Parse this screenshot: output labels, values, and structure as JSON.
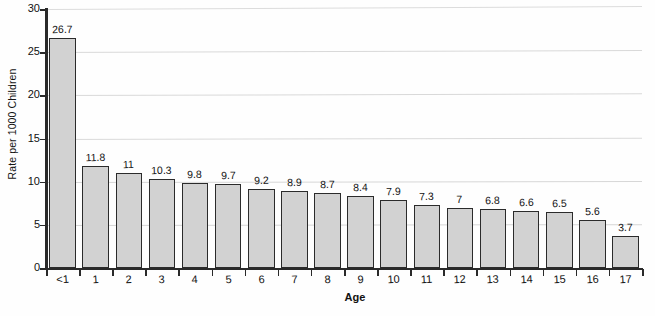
{
  "chart_data": {
    "type": "bar",
    "title": "",
    "xlabel": "Age",
    "ylabel": "Rate per 1000 Children",
    "categories": [
      "<1",
      "1",
      "2",
      "3",
      "4",
      "5",
      "6",
      "7",
      "8",
      "9",
      "10",
      "11",
      "12",
      "13",
      "14",
      "15",
      "16",
      "17"
    ],
    "values": [
      26.7,
      11.8,
      11,
      10.3,
      9.8,
      9.7,
      9.2,
      8.9,
      8.7,
      8.4,
      7.9,
      7.3,
      7,
      6.8,
      6.6,
      6.5,
      5.6,
      3.7
    ],
    "value_labels": [
      "26.7",
      "11.8",
      "11",
      "10.3",
      "9.8",
      "9.7",
      "9.2",
      "8.9",
      "8.7",
      "8.4",
      "7.9",
      "7.3",
      "7",
      "6.8",
      "6.6",
      "6.5",
      "5.6",
      "3.7"
    ],
    "ylim": [
      0,
      30
    ],
    "yticks": [
      0,
      5,
      10,
      15,
      20,
      25,
      30
    ],
    "ytick_labels": [
      "0",
      "5",
      "10",
      "15",
      "20",
      "25",
      "30"
    ],
    "grid": true,
    "legend": false,
    "bar_color": "#d2d2d2",
    "bar_edge_color": "#2b2b2b",
    "axis_color": "#2a2a2a",
    "grid_color": "#d8d8d8",
    "background_color": "#fefefe"
  }
}
